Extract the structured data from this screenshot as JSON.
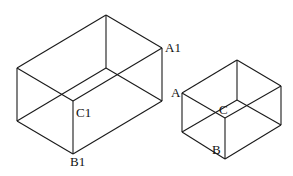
{
  "diagram": {
    "stroke_color": "#1a1a1a",
    "boxes": [
      {
        "name": "large-box",
        "edges": [
          [
            106,
            15,
            17,
            68
          ],
          [
            106,
            15,
            162,
            48
          ],
          [
            17,
            68,
            73,
            101
          ],
          [
            73,
            101,
            162,
            48
          ],
          [
            17,
            68,
            17,
            121
          ],
          [
            73,
            101,
            73,
            154
          ],
          [
            162,
            48,
            162,
            101
          ],
          [
            106,
            15,
            106,
            68
          ],
          [
            17,
            121,
            73,
            154
          ],
          [
            73,
            154,
            162,
            101
          ],
          [
            17,
            121,
            106,
            68
          ],
          [
            106,
            68,
            162,
            101
          ]
        ],
        "labels": [
          {
            "text": "A1",
            "x": 165,
            "y": 41
          },
          {
            "text": "C1",
            "x": 76,
            "y": 106
          },
          {
            "text": "B1",
            "x": 70,
            "y": 155
          }
        ]
      },
      {
        "name": "small-box",
        "edges": [
          [
            237,
            60,
            182,
            93
          ],
          [
            237,
            60,
            281,
            86
          ],
          [
            182,
            93,
            225,
            118
          ],
          [
            225,
            118,
            281,
            86
          ],
          [
            182,
            93,
            182,
            132
          ],
          [
            225,
            118,
            225,
            159
          ],
          [
            281,
            86,
            281,
            125
          ],
          [
            237,
            60,
            237,
            100
          ],
          [
            182,
            132,
            225,
            159
          ],
          [
            225,
            159,
            281,
            125
          ],
          [
            182,
            132,
            237,
            100
          ],
          [
            237,
            100,
            281,
            125
          ]
        ],
        "labels": [
          {
            "text": "A",
            "x": 171,
            "y": 86
          },
          {
            "text": "C",
            "x": 219,
            "y": 103
          },
          {
            "text": "B",
            "x": 212,
            "y": 143
          }
        ]
      }
    ]
  }
}
